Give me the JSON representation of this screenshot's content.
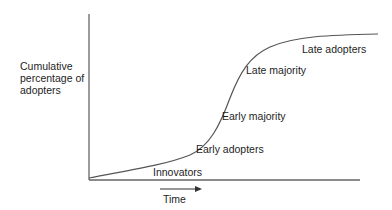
{
  "diagram": {
    "y_axis_label": [
      "Cumulative",
      "percentage of",
      "adopters"
    ],
    "x_axis_label": "Time",
    "stages": [
      {
        "label": "Innovators"
      },
      {
        "label": "Early adopters"
      },
      {
        "label": "Early majority"
      },
      {
        "label": "Late majority"
      },
      {
        "label": "Late adopters"
      }
    ],
    "curve_type": "S-curve (sigmoid)",
    "colors": {
      "line": "#555555",
      "text": "#1e1e1e",
      "background": "#ffffff"
    }
  }
}
